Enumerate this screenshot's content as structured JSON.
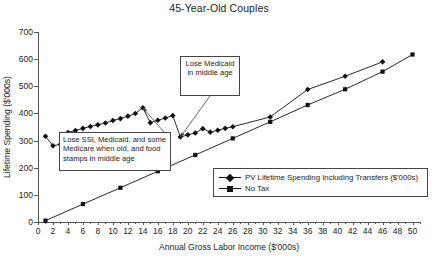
{
  "chart_data": {
    "type": "line",
    "title": "45-Year-Old Couples",
    "xlabel": "Annual Gross Labor Income ($'000s)",
    "ylabel": "Lifetime Spending ($'000s)",
    "xlim": [
      0,
      51
    ],
    "ylim": [
      0,
      700
    ],
    "xticks": [
      0,
      2,
      4,
      6,
      8,
      10,
      12,
      14,
      16,
      18,
      20,
      22,
      24,
      26,
      28,
      30,
      32,
      34,
      36,
      38,
      40,
      42,
      44,
      46,
      48,
      50
    ],
    "yticks": [
      0,
      100,
      200,
      300,
      400,
      500,
      600,
      700
    ],
    "grid": false,
    "legend_position": "lower-right",
    "series": [
      {
        "name": "PV Lifetime Spending Including Transfers ($'000s)",
        "marker": "diamond",
        "points": [
          [
            1,
            316
          ],
          [
            2,
            281
          ],
          [
            3,
            286
          ],
          [
            4,
            330
          ],
          [
            5,
            337
          ],
          [
            6,
            345
          ],
          [
            7,
            352
          ],
          [
            8,
            358
          ],
          [
            9,
            365
          ],
          [
            10,
            374
          ],
          [
            11,
            381
          ],
          [
            12,
            390
          ],
          [
            13,
            400
          ],
          [
            14,
            421
          ],
          [
            15,
            366
          ],
          [
            16,
            375
          ],
          [
            17,
            383
          ],
          [
            18,
            392
          ],
          [
            19,
            313
          ],
          [
            20,
            321
          ],
          [
            21,
            328
          ],
          [
            22,
            344
          ],
          [
            23,
            331
          ],
          [
            24,
            338
          ],
          [
            25,
            345
          ],
          [
            26,
            351
          ],
          [
            31,
            387
          ],
          [
            36,
            488
          ],
          [
            41,
            537
          ],
          [
            46,
            590
          ]
        ]
      },
      {
        "name": "No Tax",
        "marker": "square",
        "points": [
          [
            1,
            5
          ],
          [
            6,
            66
          ],
          [
            11,
            126
          ],
          [
            16,
            187
          ],
          [
            21,
            247
          ],
          [
            26,
            308
          ],
          [
            31,
            369
          ],
          [
            36,
            431
          ],
          [
            41,
            489
          ],
          [
            46,
            554
          ],
          [
            50,
            617
          ]
        ]
      }
    ],
    "annotations": [
      {
        "id": "lose-medicaid",
        "text": "Lose Medicaid in middle age",
        "target_x": 19,
        "target_y": 313
      },
      {
        "id": "lose-ssi",
        "text": "Lose SSI, Medicaid, and some Medicare when old, and food stamps in middle age",
        "target_x": 14,
        "target_y": 421
      }
    ]
  },
  "legend": {
    "items": [
      {
        "label": "PV Lifetime Spending Including Transfers ($'000s)",
        "marker": "diamond"
      },
      {
        "label": "No Tax",
        "marker": "square"
      }
    ]
  }
}
